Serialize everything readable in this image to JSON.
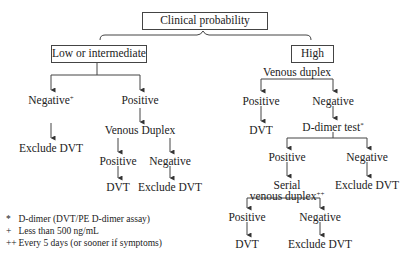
{
  "root": {
    "label": "Clinical probability"
  },
  "low": {
    "label": "Low or intermediate",
    "negative": {
      "label": "Negative",
      "sup": "+",
      "outcome": "Exclude DVT"
    },
    "positive": {
      "label": "Positive",
      "test": "Venous Duplex",
      "pos": {
        "label": "Positive",
        "outcome": "DVT"
      },
      "neg": {
        "label": "Negative",
        "outcome": "Exclude DVT"
      }
    }
  },
  "high": {
    "label": "High",
    "test": "Venous duplex",
    "positive": {
      "label": "Positive",
      "outcome": "DVT"
    },
    "negative": {
      "label": "Negative",
      "test": "D-dimer test",
      "test_sup": "*",
      "pos": {
        "label": "Positive",
        "test_line1": "Serial",
        "test_line2": "venous duplex",
        "test_sup": "++",
        "pos": {
          "label": "Positive",
          "outcome": "DVT"
        },
        "neg": {
          "label": "Negative",
          "outcome": "Exclude DVT"
        }
      },
      "neg": {
        "label": "Negative",
        "outcome": "Exclude DVT"
      }
    }
  },
  "footnotes": [
    {
      "mark": "*",
      "text": "D-dimer (DVT/PE D-dimer assay)"
    },
    {
      "mark": "+",
      "text": "Less than 500 ng/mL"
    },
    {
      "mark": "++",
      "text": "Every 5 days (or sooner if symptoms)"
    }
  ]
}
